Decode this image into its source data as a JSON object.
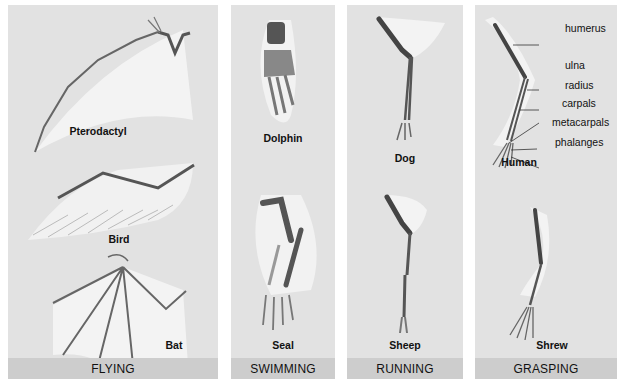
{
  "panels": [
    {
      "name": "flying",
      "footer": "FLYING",
      "animals": [
        "Pterodactyl",
        "Bird",
        "Bat"
      ]
    },
    {
      "name": "swimming",
      "footer": "SWIMMING",
      "animals": [
        "Dolphin",
        "Seal"
      ]
    },
    {
      "name": "running",
      "footer": "RUNNING",
      "animals": [
        "Dog",
        "Sheep"
      ]
    },
    {
      "name": "grasping",
      "footer": "GRASPING",
      "animals": [
        "Human",
        "Shrew"
      ]
    }
  ],
  "bone_labels": [
    "humerus",
    "ulna",
    "radius",
    "carpals",
    "metacarpals",
    "phalanges"
  ],
  "colors": {
    "panel_bg": "#e2e2e2",
    "footer_bg": "#cdcdcd",
    "bone_dark": "#555555",
    "membrane": "#f4f4f4"
  }
}
